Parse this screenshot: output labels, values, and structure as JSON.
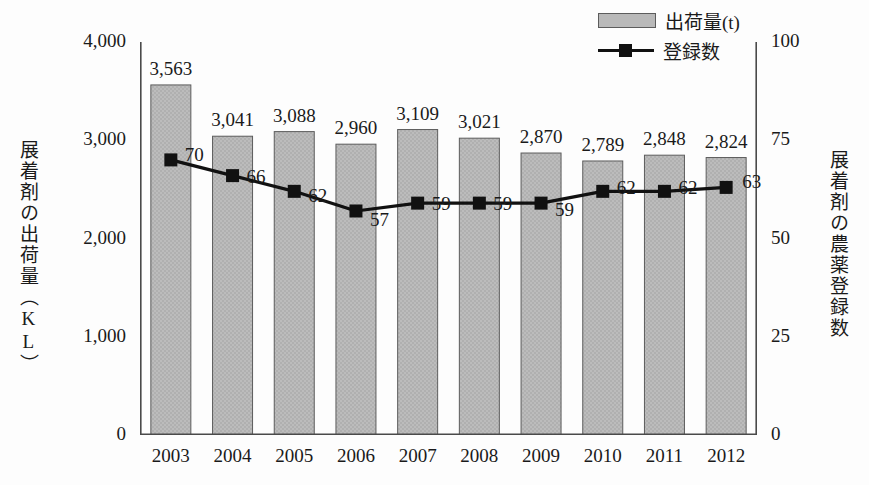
{
  "chart_data": {
    "type": "bar",
    "title": "",
    "subtitle": "",
    "xlabel": "",
    "ylabel": "展着剤の出荷量（KL）",
    "y2label": "展着剤の農薬登録数",
    "categories": [
      "2003",
      "2004",
      "2005",
      "2006",
      "2007",
      "2008",
      "2009",
      "2010",
      "2011",
      "2012"
    ],
    "series": [
      {
        "name": "出荷量(t)",
        "type": "bar",
        "axis": "left",
        "values": [
          3563,
          3041,
          3088,
          2960,
          3109,
          3021,
          2870,
          2789,
          2848,
          2824
        ],
        "labels": [
          "3,563",
          "3,041",
          "3,088",
          "2,960",
          "3,109",
          "3,021",
          "2,870",
          "2,789",
          "2,848",
          "2,824"
        ],
        "color": "#b9b9b9",
        "edge_color": "#5c5c5c"
      },
      {
        "name": "登録数",
        "type": "line",
        "axis": "right",
        "values": [
          70,
          66,
          62,
          57,
          59,
          59,
          59,
          62,
          62,
          63
        ],
        "labels": [
          "70",
          "66",
          "62",
          "57",
          "59",
          "59",
          "59",
          "62",
          "62",
          "63"
        ],
        "color": "#111111",
        "marker": "square"
      }
    ],
    "ylim": [
      0,
      4000
    ],
    "yticks": [
      0,
      1000,
      2000,
      3000,
      4000
    ],
    "ytick_labels": [
      "0",
      "1,000",
      "2,000",
      "3,000",
      "4,000"
    ],
    "y2lim": [
      0,
      100
    ],
    "y2ticks": [
      0,
      25,
      50,
      75,
      100
    ],
    "y2tick_labels": [
      "0",
      "25",
      "50",
      "75",
      "100"
    ],
    "grid": false,
    "legend_position": "top-right"
  },
  "legend": {
    "items": [
      {
        "label": "出荷量(t)",
        "swatch": "bar-swatch"
      },
      {
        "label": "登録数",
        "swatch": "line-marker-swatch"
      }
    ]
  },
  "axes": {
    "left_title": "展着剤の出荷量（KL）",
    "right_title": "展着剤の農薬登録数",
    "left_ticks": [
      "4,000",
      "3,000",
      "2,000",
      "1,000",
      "0"
    ],
    "right_ticks": [
      "100",
      "75",
      "50",
      "25",
      "0"
    ]
  }
}
